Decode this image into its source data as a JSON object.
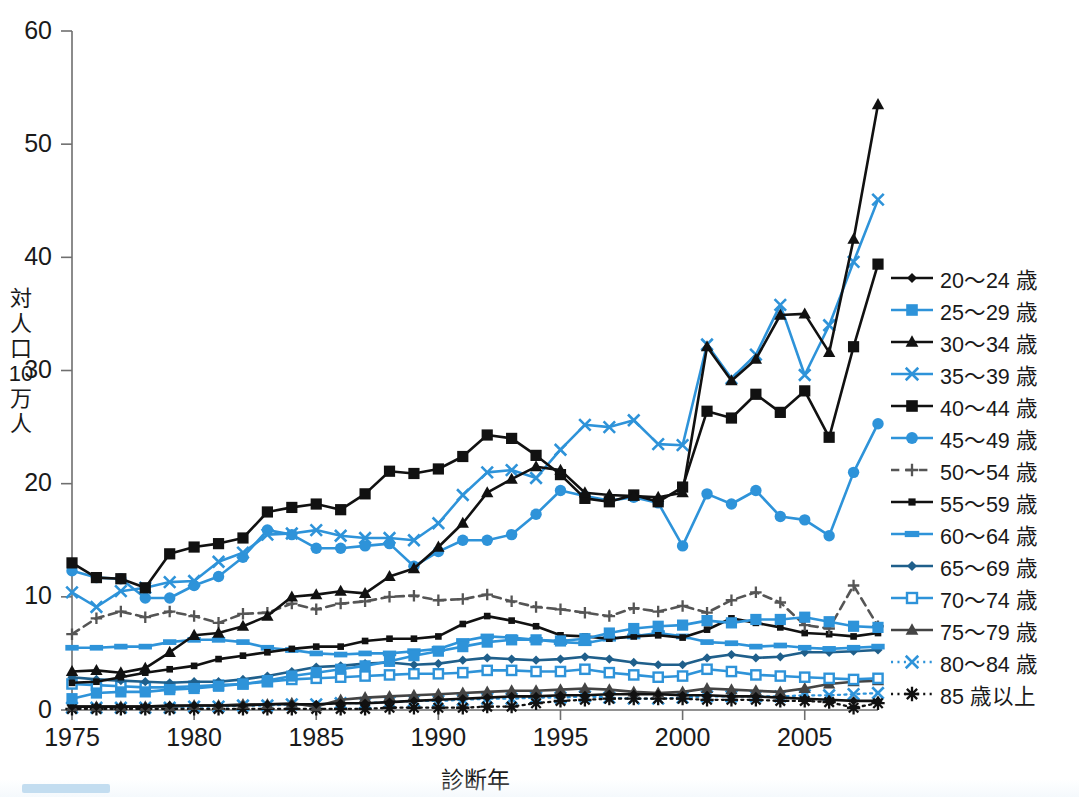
{
  "chart_data": {
    "type": "line",
    "title": "",
    "xlabel": "診断年",
    "ylabel": "対人口10万人",
    "ylabel_chars": [
      "対",
      "人",
      "口",
      "10",
      "万",
      "人"
    ],
    "xlim": [
      1975,
      2008
    ],
    "ylim": [
      0,
      60
    ],
    "yticks": [
      0,
      10,
      20,
      30,
      40,
      50,
      60
    ],
    "xticks": [
      1975,
      1980,
      1985,
      1990,
      1995,
      2000,
      2005
    ],
    "grid": false,
    "legend_position": "right",
    "colors": {
      "black": "#111111",
      "blue": "#2e93d9",
      "dark_blue": "#1f5f8b",
      "gray": "#555555"
    },
    "x": [
      1975,
      1976,
      1977,
      1978,
      1979,
      1980,
      1981,
      1982,
      1983,
      1984,
      1985,
      1986,
      1987,
      1988,
      1989,
      1990,
      1991,
      1992,
      1993,
      1994,
      1995,
      1996,
      1997,
      1998,
      1999,
      2000,
      2001,
      2002,
      2003,
      2004,
      2005,
      2006,
      2007,
      2008
    ],
    "series": [
      {
        "name": "20～24 歳",
        "color": "#111111",
        "marker": "diamond",
        "dash": "solid",
        "values": [
          0.3,
          0.3,
          0.3,
          0.3,
          0.4,
          0.4,
          0.4,
          0.4,
          0.5,
          0.5,
          0.5,
          0.6,
          0.6,
          0.7,
          0.8,
          0.9,
          1.0,
          1.1,
          1.2,
          1.2,
          1.3,
          1.3,
          1.4,
          1.4,
          1.4,
          1.3,
          1.3,
          1.2,
          1.2,
          1.1,
          1.0,
          0.9,
          0.8,
          0.8
        ]
      },
      {
        "name": "25～29 歳",
        "color": "#2e93d9",
        "marker": "square-filled",
        "dash": "solid",
        "values": [
          1.0,
          1.5,
          1.6,
          1.6,
          1.8,
          1.9,
          2.1,
          2.3,
          2.6,
          3.0,
          3.3,
          3.6,
          3.9,
          4.3,
          4.8,
          5.2,
          5.6,
          6.0,
          6.2,
          6.2,
          6.1,
          6.3,
          6.8,
          7.2,
          7.4,
          7.5,
          7.9,
          7.7,
          8.0,
          8.0,
          8.2,
          7.8,
          7.4,
          7.3
        ]
      },
      {
        "name": "30～34 歳",
        "color": "#111111",
        "marker": "triangle-filled",
        "dash": "solid",
        "values": [
          3.4,
          3.5,
          3.3,
          3.7,
          5.1,
          6.6,
          6.8,
          7.4,
          8.3,
          10.0,
          10.2,
          10.5,
          10.3,
          11.8,
          12.5,
          14.4,
          16.5,
          19.2,
          20.4,
          21.5,
          21.2,
          19.2,
          19.0,
          18.9,
          18.8,
          19.2,
          32.1,
          29.1,
          31.0,
          34.9,
          35.0,
          31.6,
          41.6,
          53.5
        ]
      },
      {
        "name": "35～39 歳",
        "color": "#2e93d9",
        "marker": "x",
        "dash": "solid",
        "values": [
          10.4,
          9.1,
          10.5,
          10.8,
          11.3,
          11.4,
          13.1,
          13.9,
          15.5,
          15.6,
          15.9,
          15.4,
          15.2,
          15.2,
          15.0,
          16.5,
          19.0,
          21.0,
          21.2,
          20.5,
          23.0,
          25.2,
          25.0,
          25.6,
          23.5,
          23.4,
          32.3,
          29.3,
          31.4,
          35.8,
          29.6,
          34.0,
          39.6,
          45.1
        ]
      },
      {
        "name": "40～44 歳",
        "color": "#111111",
        "marker": "square-filled",
        "dash": "solid",
        "values": [
          13.0,
          11.7,
          11.6,
          10.8,
          13.8,
          14.4,
          14.7,
          15.2,
          17.5,
          17.9,
          18.2,
          17.7,
          19.1,
          21.1,
          20.9,
          21.3,
          22.4,
          24.3,
          24.0,
          22.5,
          20.8,
          18.7,
          18.4,
          19.0,
          18.4,
          19.7,
          26.4,
          25.8,
          27.9,
          26.3,
          28.2,
          24.1,
          32.1,
          39.4
        ]
      },
      {
        "name": "45～49 歳",
        "color": "#2e93d9",
        "marker": "circle-filled",
        "dash": "solid",
        "values": [
          12.3,
          11.7,
          11.6,
          9.9,
          9.9,
          11.0,
          11.8,
          13.5,
          15.9,
          15.5,
          14.3,
          14.3,
          14.5,
          14.7,
          12.7,
          14.0,
          15.0,
          15.0,
          15.5,
          17.3,
          19.4,
          18.9,
          18.5,
          18.8,
          18.3,
          14.5,
          19.1,
          18.2,
          19.4,
          17.1,
          16.8,
          15.4,
          21.0,
          25.3
        ]
      },
      {
        "name": "50～54 歳",
        "color": "#555555",
        "marker": "plus",
        "dash": "dash",
        "values": [
          6.7,
          8.1,
          8.7,
          8.2,
          8.7,
          8.3,
          7.7,
          8.5,
          8.6,
          9.4,
          8.9,
          9.4,
          9.6,
          10.0,
          10.1,
          9.7,
          9.8,
          10.2,
          9.6,
          9.1,
          8.9,
          8.6,
          8.3,
          9.0,
          8.7,
          9.2,
          8.6,
          9.7,
          10.4,
          9.5,
          7.5,
          7.2,
          11.0,
          7.4
        ]
      },
      {
        "name": "55～59 歳",
        "color": "#111111",
        "marker": "square-small",
        "dash": "solid",
        "values": [
          2.4,
          2.5,
          2.9,
          3.3,
          3.6,
          3.9,
          4.5,
          4.8,
          5.1,
          5.4,
          5.6,
          5.6,
          6.1,
          6.3,
          6.3,
          6.5,
          7.6,
          8.3,
          7.9,
          7.4,
          6.6,
          6.5,
          6.3,
          6.5,
          6.6,
          6.4,
          7.1,
          8.1,
          7.7,
          7.3,
          6.8,
          6.7,
          6.5,
          6.8
        ]
      },
      {
        "name": "60～64 歳",
        "color": "#2e93d9",
        "marker": "rect-wide",
        "dash": "solid",
        "values": [
          5.5,
          5.5,
          5.6,
          5.6,
          6.0,
          6.2,
          6.2,
          6.0,
          5.5,
          5.3,
          5.0,
          4.9,
          5.0,
          5.0,
          5.2,
          5.4,
          6.1,
          6.5,
          6.4,
          6.2,
          6.0,
          5.9,
          6.3,
          6.5,
          6.8,
          6.5,
          6.0,
          5.9,
          5.6,
          5.7,
          5.5,
          5.4,
          5.5,
          5.6
        ]
      },
      {
        "name": "65～69 歳",
        "color": "#1f5f8b",
        "marker": "diamond",
        "dash": "solid",
        "values": [
          2.9,
          2.7,
          2.6,
          2.5,
          2.4,
          2.5,
          2.5,
          2.7,
          3.0,
          3.4,
          3.8,
          3.9,
          4.1,
          4.2,
          4.0,
          4.1,
          4.4,
          4.6,
          4.5,
          4.4,
          4.5,
          4.7,
          4.5,
          4.2,
          4.0,
          4.0,
          4.6,
          4.9,
          4.6,
          4.7,
          5.1,
          5.1,
          5.2,
          5.3
        ]
      },
      {
        "name": "70～74 歳",
        "color": "#2e93d9",
        "marker": "square-open",
        "dash": "solid",
        "values": [
          2.3,
          2.2,
          2.1,
          2.0,
          2.0,
          2.1,
          2.2,
          2.3,
          2.5,
          2.7,
          2.8,
          2.9,
          3.0,
          3.1,
          3.2,
          3.2,
          3.3,
          3.5,
          3.5,
          3.4,
          3.4,
          3.6,
          3.3,
          3.1,
          2.9,
          3.0,
          3.6,
          3.4,
          3.1,
          3.0,
          2.9,
          2.8,
          2.7,
          2.8
        ]
      },
      {
        "name": "75～79 歳",
        "color": "#444444",
        "marker": "triangle-filled",
        "dash": "solid",
        "values": [
          0.3,
          0.3,
          0.3,
          0.3,
          0.3,
          0.4,
          0.4,
          0.5,
          0.5,
          0.6,
          0.3,
          0.9,
          1.1,
          1.2,
          1.3,
          1.4,
          1.5,
          1.6,
          1.7,
          1.7,
          1.8,
          1.9,
          1.8,
          1.6,
          1.5,
          1.6,
          1.9,
          1.8,
          1.7,
          1.6,
          1.9,
          2.3,
          2.5,
          2.6
        ]
      },
      {
        "name": "80～84 歳",
        "color": "#2e93d9",
        "marker": "x",
        "dash": "dot",
        "values": [
          0.2,
          0.2,
          0.2,
          0.2,
          0.2,
          0.3,
          0.3,
          0.4,
          0.4,
          0.5,
          0.5,
          0.6,
          0.6,
          0.7,
          0.8,
          0.8,
          0.9,
          1.0,
          1.0,
          1.1,
          1.1,
          1.2,
          1.1,
          1.0,
          1.0,
          1.1,
          1.2,
          1.2,
          1.2,
          1.2,
          1.3,
          1.3,
          1.4,
          1.5
        ]
      },
      {
        "name": "85 歳以上",
        "color": "#111111",
        "marker": "asterisk",
        "dash": "dot",
        "values": [
          0.1,
          0.1,
          0.1,
          0.1,
          0.1,
          0.1,
          0.1,
          0.1,
          0.1,
          0.1,
          0.1,
          0.1,
          0.1,
          0.2,
          0.2,
          0.2,
          0.2,
          0.3,
          0.3,
          0.6,
          0.8,
          0.9,
          1.0,
          1.0,
          1.0,
          1.0,
          0.9,
          0.9,
          0.9,
          0.8,
          0.8,
          0.7,
          0.2,
          0.6
        ]
      }
    ]
  },
  "legend": {
    "items": [
      {
        "label": "20～24 歳"
      },
      {
        "label": "25～29 歳"
      },
      {
        "label": "30～34 歳"
      },
      {
        "label": "35～39 歳"
      },
      {
        "label": "40～44 歳"
      },
      {
        "label": "45～49 歳"
      },
      {
        "label": "50～54 歳"
      },
      {
        "label": "55～59 歳"
      },
      {
        "label": "60～64 歳"
      },
      {
        "label": "65～69 歳"
      },
      {
        "label": "70～74 歳"
      },
      {
        "label": "75～79 歳"
      },
      {
        "label": "80～84 歳"
      },
      {
        "label": "85 歳以上"
      }
    ]
  }
}
